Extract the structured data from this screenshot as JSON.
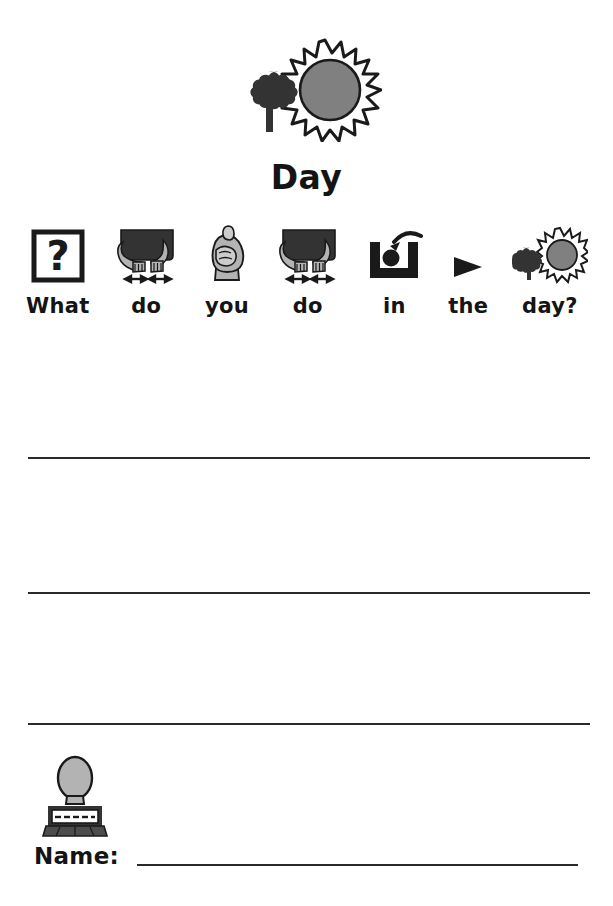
{
  "worksheet": {
    "title": "Day",
    "header_icon": "tree-and-sun-icon",
    "sentence": [
      {
        "word": "What",
        "icon": "question-mark-box-icon"
      },
      {
        "word": "do",
        "icon": "two-hands-doing-icon"
      },
      {
        "word": "you",
        "icon": "pointing-fist-icon"
      },
      {
        "word": "do",
        "icon": "two-hands-doing-icon"
      },
      {
        "word": "in",
        "icon": "ball-in-container-icon"
      },
      {
        "word": "the",
        "icon": "right-triangle-pointer-icon"
      },
      {
        "word": "day?",
        "icon": "tree-and-sun-icon"
      }
    ],
    "sentence_text": "What do you do in the day?",
    "answer_lines": [
      {
        "index": 1
      },
      {
        "index": 2
      },
      {
        "index": 3
      }
    ],
    "name_row": {
      "icon": "person-nameplate-icon",
      "label": "Name:",
      "value": ""
    },
    "colors": {
      "ink": "#141414",
      "line": "#2a2a2a",
      "symbol_gray": "#808080",
      "symbol_dark": "#333333",
      "symbol_light_gray": "#b3b3b3",
      "page": "#ffffff"
    }
  }
}
